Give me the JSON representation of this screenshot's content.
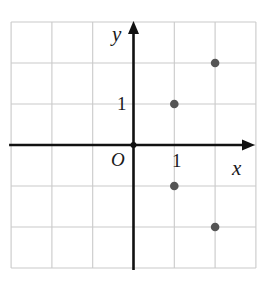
{
  "figure": {
    "type": "coordinate-plane-scatter",
    "background_color": "#ffffff"
  },
  "axes": {
    "x_axis_label": "x",
    "y_axis_label": "y",
    "origin_label": "O",
    "x_tick_label": "1",
    "y_tick_label": "1",
    "axis_color": "#111111",
    "grid_color": "#c9c9c9",
    "grid_visible": true
  },
  "chart_data": {
    "type": "scatter",
    "title": "",
    "xlabel": "x",
    "ylabel": "y",
    "xlim": [
      -3,
      3
    ],
    "ylim": [
      -3,
      3
    ],
    "xticks": [
      1
    ],
    "yticks": [
      1
    ],
    "xtick_labels": [
      "1"
    ],
    "ytick_labels": [
      "1"
    ],
    "grid": true,
    "grid_step": 1,
    "origin_label": "O",
    "legend": null,
    "point_color": "#555555",
    "points": [
      {
        "x": 2,
        "y": 2
      },
      {
        "x": 1,
        "y": 1
      },
      {
        "x": 1,
        "y": -1
      },
      {
        "x": 2,
        "y": -2
      }
    ]
  }
}
